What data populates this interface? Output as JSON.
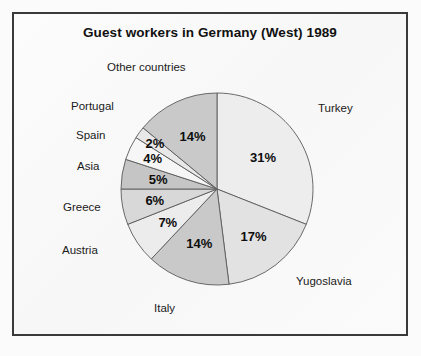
{
  "figure": {
    "title": "Guest workers in Germany (West) 1989",
    "frame_color": "#3a3a3a",
    "background": "#fbfbfb"
  },
  "chart_data": {
    "type": "pie",
    "title": "Guest workers in Germany (West) 1989",
    "xlabel": "",
    "ylabel": "",
    "unit": "%",
    "start_angle_deg": 0,
    "direction": "clockwise",
    "legend": "none (direct labels)",
    "grid": false,
    "categories": [
      "Turkey",
      "Yugoslavia",
      "Italy",
      "Austria",
      "Greece",
      "Asia",
      "Spain",
      "Portugal",
      "Other countries"
    ],
    "values": [
      31,
      17,
      14,
      7,
      6,
      5,
      4,
      2,
      14
    ],
    "value_labels": [
      "31%",
      "17%",
      "14%",
      "7%",
      "6%",
      "5%",
      "4%",
      "2%",
      "14%"
    ],
    "colors": [
      "#ededed",
      "#e2e2e2",
      "#c9c9c9",
      "#ececec",
      "#d8d8d8",
      "#c5c5c5",
      "#f6f6f6",
      "#e8e8e8",
      "#c9c9c9"
    ],
    "slices": [
      {
        "name": "Turkey",
        "value": 31,
        "label": "31%",
        "color": "#ededed"
      },
      {
        "name": "Yugoslavia",
        "value": 17,
        "label": "17%",
        "color": "#e2e2e2"
      },
      {
        "name": "Italy",
        "value": 14,
        "label": "14%",
        "color": "#c9c9c9"
      },
      {
        "name": "Austria",
        "value": 7,
        "label": "7%",
        "color": "#ececec"
      },
      {
        "name": "Greece",
        "value": 6,
        "label": "6%",
        "color": "#d8d8d8"
      },
      {
        "name": "Asia",
        "value": 5,
        "label": "5%",
        "color": "#c5c5c5"
      },
      {
        "name": "Spain",
        "value": 4,
        "label": "4%",
        "color": "#f6f6f6"
      },
      {
        "name": "Portugal",
        "value": 2,
        "label": "2%",
        "color": "#e8e8e8"
      },
      {
        "name": "Other countries",
        "value": 14,
        "label": "14%",
        "color": "#c9c9c9"
      }
    ]
  }
}
